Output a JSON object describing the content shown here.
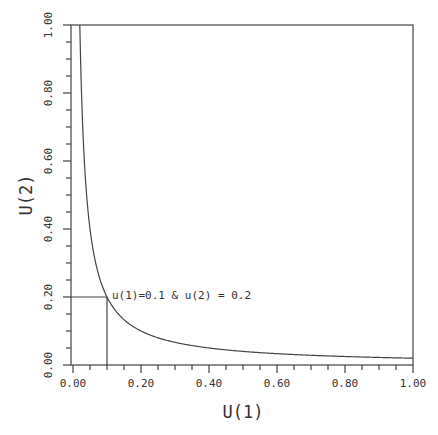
{
  "chart_data": {
    "type": "line",
    "title": "",
    "xlabel": "U(1)",
    "ylabel": "U(2)",
    "xlim": [
      0,
      1
    ],
    "ylim": [
      0,
      1
    ],
    "grid": false,
    "x_ticks": [
      "0.00",
      "0.20",
      "0.40",
      "0.60",
      "0.80",
      "1.00"
    ],
    "y_ticks": [
      "0.00",
      "0.20",
      "0.40",
      "0.60",
      "0.80",
      "1.00"
    ],
    "series": [
      {
        "name": "U(1)*U(2) = 0.02",
        "x": [
          0.02,
          0.025,
          0.03,
          0.04,
          0.05,
          0.06,
          0.08,
          0.1,
          0.12,
          0.15,
          0.2,
          0.25,
          0.3,
          0.4,
          0.5,
          0.6,
          0.7,
          0.8,
          0.9,
          1.0
        ],
        "y": [
          1.0,
          0.8,
          0.667,
          0.5,
          0.4,
          0.333,
          0.25,
          0.2,
          0.167,
          0.133,
          0.1,
          0.08,
          0.067,
          0.05,
          0.04,
          0.033,
          0.029,
          0.025,
          0.022,
          0.02
        ]
      }
    ],
    "reference_point": {
      "x": 0.1,
      "y": 0.2
    },
    "annotations": [
      {
        "text": "u(1)=0.1 & u(2) = 0.2",
        "x": 0.1,
        "y": 0.2
      }
    ]
  }
}
